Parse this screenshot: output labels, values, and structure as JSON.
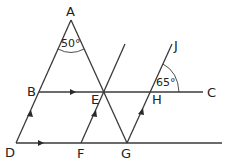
{
  "diagram": {
    "type": "geometry",
    "points": {
      "A": {
        "label": "A",
        "x": 71,
        "y": 20
      },
      "B": {
        "label": "B",
        "x": 39,
        "y": 92
      },
      "C": {
        "label": "C",
        "x": 203,
        "y": 92
      },
      "D": {
        "label": "D",
        "x": 16,
        "y": 143
      },
      "E": {
        "label": "E",
        "x": 103,
        "y": 92
      },
      "F": {
        "label": "F",
        "x": 81,
        "y": 143
      },
      "G": {
        "label": "G",
        "x": 127,
        "y": 143
      },
      "H": {
        "label": "H",
        "x": 150,
        "y": 92
      },
      "J": {
        "label": "J",
        "x": 172,
        "y": 44
      }
    },
    "angles": {
      "A": "50°",
      "H": "65°"
    },
    "parallel_marks": {
      "BC_DG": "single arrow",
      "DA_FE_GJ": "single arrow"
    }
  }
}
